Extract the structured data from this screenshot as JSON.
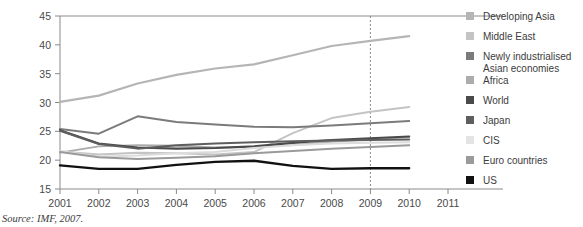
{
  "source_note": "Source: IMF, 2007.",
  "chart_data": {
    "type": "line",
    "title": "",
    "xlabel": "",
    "ylabel": "Investment (%GDP)",
    "x": [
      2001,
      2002,
      2003,
      2004,
      2005,
      2006,
      2007,
      2008,
      2009,
      2010,
      2011
    ],
    "xlim": [
      2001,
      2011
    ],
    "ylim": [
      15,
      45
    ],
    "xticks": [
      "2001",
      "2002",
      "2003",
      "2004",
      "2005",
      "2006",
      "2007",
      "2008",
      "2009",
      "2010",
      "2011"
    ],
    "yticks": [
      "15",
      "20",
      "25",
      "30",
      "35",
      "40",
      "45"
    ],
    "grid": false,
    "legend_position": "right",
    "annotations": [
      {
        "name": "forecast-divider",
        "type": "vline",
        "x": 2009,
        "style": "dashed"
      }
    ],
    "series": [
      {
        "name": "Developing Asia",
        "color": "#b5b5b5",
        "width": 2.2,
        "x": [
          2001,
          2002,
          2003,
          2004,
          2005,
          2006,
          2007,
          2008,
          2009,
          2010
        ],
        "values": [
          30.1,
          31.2,
          33.3,
          34.8,
          35.9,
          36.6,
          38.2,
          39.8,
          40.7,
          41.5
        ]
      },
      {
        "name": "Middle East",
        "color": "#c4c4c4",
        "width": 2.0,
        "x": [
          2001,
          2002,
          2003,
          2004,
          2005,
          2006,
          2007,
          2008,
          2009,
          2010
        ],
        "values": [
          21.5,
          21.0,
          21.3,
          21.2,
          21.0,
          21.4,
          24.7,
          27.3,
          28.4,
          29.2
        ]
      },
      {
        "name": "Newly industrialised Asian economies",
        "color": "#7b7b7b",
        "width": 2.0,
        "x": [
          2001,
          2002,
          2003,
          2004,
          2005,
          2006,
          2007,
          2008,
          2009,
          2010
        ],
        "values": [
          25.4,
          24.6,
          27.6,
          26.6,
          26.2,
          25.8,
          25.7,
          26.0,
          26.4,
          26.8
        ]
      },
      {
        "name": "Africa",
        "color": "#acacac",
        "width": 1.9,
        "x": [
          2001,
          2002,
          2003,
          2004,
          2005,
          2006,
          2007,
          2008,
          2009,
          2010
        ],
        "values": [
          21.3,
          22.4,
          22.6,
          22.5,
          22.2,
          22.3,
          22.6,
          23.2,
          23.6,
          24.0
        ]
      },
      {
        "name": "World",
        "color": "#4a4a4a",
        "width": 2.1,
        "x": [
          2001,
          2002,
          2003,
          2004,
          2005,
          2006,
          2007,
          2008,
          2009,
          2010
        ],
        "values": [
          25.2,
          22.9,
          22.2,
          22.0,
          22.1,
          22.4,
          23.0,
          23.5,
          23.8,
          24.1
        ]
      },
      {
        "name": "Japan",
        "color": "#5e5e5e",
        "width": 2.0,
        "x": [
          2001,
          2002,
          2003,
          2004,
          2005,
          2006,
          2007,
          2008,
          2009,
          2010
        ],
        "values": [
          25.1,
          22.8,
          22.0,
          22.6,
          22.9,
          23.1,
          23.3,
          23.4,
          23.5,
          23.6
        ]
      },
      {
        "name": "CIS",
        "color": "#dcdcdc",
        "width": 2.0,
        "x": [
          2001,
          2002,
          2003,
          2004,
          2005,
          2006,
          2007,
          2008,
          2009,
          2010
        ],
        "values": [
          21.6,
          20.6,
          20.8,
          21.2,
          21.4,
          22.1,
          22.6,
          22.9,
          23.0,
          23.1
        ]
      },
      {
        "name": "Euro countries",
        "color": "#9a9a9a",
        "width": 2.0,
        "x": [
          2001,
          2002,
          2003,
          2004,
          2005,
          2006,
          2007,
          2008,
          2009,
          2010
        ],
        "values": [
          21.4,
          20.5,
          20.2,
          20.4,
          20.7,
          21.2,
          21.6,
          22.0,
          22.3,
          22.6
        ]
      },
      {
        "name": "US",
        "color": "#111111",
        "width": 2.3,
        "x": [
          2001,
          2002,
          2003,
          2004,
          2005,
          2006,
          2007,
          2008,
          2009,
          2010
        ],
        "values": [
          19.1,
          18.5,
          18.5,
          19.2,
          19.7,
          19.9,
          19.0,
          18.5,
          18.6,
          18.6
        ]
      }
    ]
  },
  "legend": {
    "items": [
      {
        "label": "Developing Asia",
        "color": "#b5b5b5"
      },
      {
        "label": "Middle East",
        "color": "#c4c4c4"
      },
      {
        "label": "Newly industrialised",
        "label2": "Asian economies",
        "color": "#7b7b7b"
      },
      {
        "label": "Africa",
        "color": "#acacac"
      },
      {
        "label": "World",
        "color": "#4a4a4a"
      },
      {
        "label": "Japan",
        "color": "#5e5e5e"
      },
      {
        "label": "CIS",
        "color": "#e4e4e4"
      },
      {
        "label": "Euro countries",
        "color": "#9a9a9a"
      },
      {
        "label": "US",
        "color": "#111111"
      }
    ]
  }
}
